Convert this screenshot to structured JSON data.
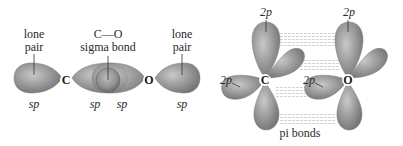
{
  "colors": {
    "orbital_fill": "#8e8e8e",
    "orbital_highlight": "#c9c9c9",
    "orbital_edge": "#6e6e6e",
    "pi_dash": "#d4d4d4",
    "text": "#2a2a2a"
  },
  "left_panel": {
    "lone_pair_left": {
      "label_line1": "lone",
      "label_line2": "pair",
      "hybrid": "sp"
    },
    "atom_c": "C",
    "sigma": {
      "title": "C—O",
      "label": "sigma bond",
      "hybrid_c": "sp",
      "hybrid_o": "sp"
    },
    "atom_o": "O",
    "lone_pair_right": {
      "label_line1": "lone",
      "label_line2": "pair",
      "hybrid": "sp"
    }
  },
  "right_panel": {
    "carbon": {
      "atom": "C",
      "p_top": "2p",
      "p_left": "2p"
    },
    "oxygen": {
      "atom": "O",
      "p_top": "2p",
      "p_left": "2p"
    },
    "pi_label": "pi bonds"
  }
}
